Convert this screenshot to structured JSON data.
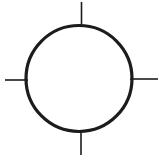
{
  "symbol": {
    "label": "circle-with-cardinal-tick-marks",
    "background_color": "#ffffff",
    "stroke_color": "#1c1c1c",
    "circle": {
      "cx": "79",
      "cy": "78.5",
      "r": "53",
      "stroke_width": "3.2"
    },
    "tick_stroke_width": "1.6",
    "ticks": {
      "top": {
        "x1": "81.5",
        "y1": "2",
        "x2": "81.5",
        "y2": "26"
      },
      "bottom": {
        "x1": "81",
        "y1": "130",
        "x2": "81",
        "y2": "155"
      },
      "left": {
        "x1": "5",
        "y1": "80",
        "x2": "28",
        "y2": "80"
      },
      "right": {
        "x1": "130",
        "y1": "79",
        "x2": "158",
        "y2": "79"
      }
    }
  }
}
